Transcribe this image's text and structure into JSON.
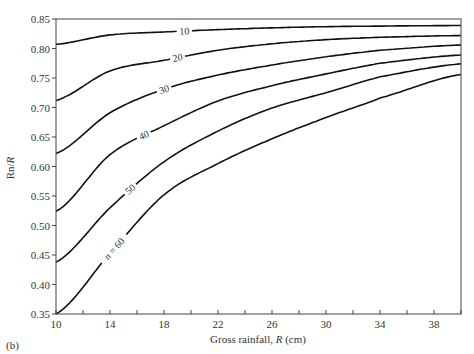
{
  "panel_label": "(b)",
  "chart_data": {
    "type": "line",
    "title": "",
    "xlabel": "Gross rainfall, R (cm)",
    "ylabel": "Rn/R",
    "xlim": [
      10,
      40
    ],
    "ylim": [
      0.35,
      0.85
    ],
    "x_ticks": [
      10,
      14,
      18,
      22,
      26,
      30,
      34,
      38
    ],
    "x_minor_step": 2,
    "y_ticks": [
      "0.35",
      "0.40",
      "0.45",
      "0.50",
      "0.55",
      "0.60",
      "0.65",
      "0.70",
      "0.75",
      "0.80",
      "0.85"
    ],
    "grid": false,
    "legend": "inline curve labels",
    "x": [
      10,
      14,
      18,
      22,
      26,
      30,
      34,
      40
    ],
    "series": [
      {
        "name": "10",
        "label": "10",
        "values": [
          0.807,
          0.823,
          0.828,
          0.832,
          0.835,
          0.837,
          0.838,
          0.839
        ]
      },
      {
        "name": "20",
        "label": "20",
        "values": [
          0.712,
          0.762,
          0.78,
          0.797,
          0.808,
          0.815,
          0.819,
          0.822
        ]
      },
      {
        "name": "30",
        "label": "30",
        "values": [
          0.622,
          0.691,
          0.731,
          0.755,
          0.772,
          0.786,
          0.797,
          0.806
        ]
      },
      {
        "name": "40",
        "label": "40",
        "values": [
          0.524,
          0.62,
          0.669,
          0.711,
          0.737,
          0.757,
          0.775,
          0.789
        ]
      },
      {
        "name": "50",
        "label": "50",
        "values": [
          0.438,
          0.53,
          0.608,
          0.66,
          0.699,
          0.725,
          0.752,
          0.774
        ]
      },
      {
        "name": "60",
        "label": "n = 60",
        "values": [
          0.35,
          0.453,
          0.552,
          0.605,
          0.647,
          0.683,
          0.716,
          0.756
        ]
      }
    ],
    "label_positions": [
      {
        "series": "10",
        "x": 19.5
      },
      {
        "series": "20",
        "x": 19.0
      },
      {
        "series": "30",
        "x": 18.0
      },
      {
        "series": "40",
        "x": 16.5
      },
      {
        "series": "50",
        "x": 15.5
      },
      {
        "series": "60",
        "x": 14.3
      }
    ]
  }
}
